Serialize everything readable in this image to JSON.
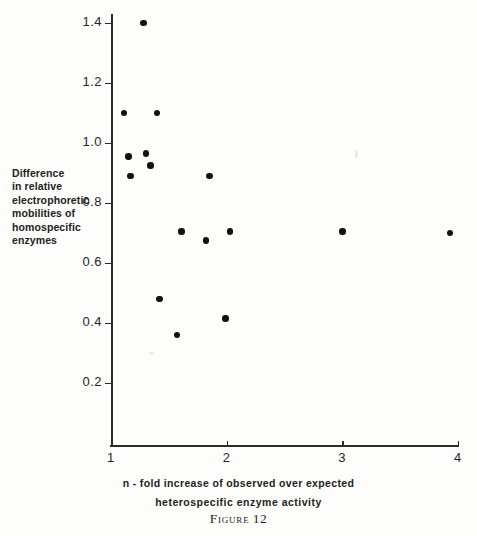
{
  "figure": {
    "caption_label": "Figure",
    "caption_number": "12"
  },
  "axes": {
    "y_title_lines": [
      "Difference",
      "in relative",
      "electrophoretic",
      "mobilities of",
      "homospecific",
      "enzymes"
    ],
    "x_title_line1": "n - fold increase of  observed  over  expected",
    "x_title_line2": "heterospecific   enzyme   activity",
    "x_ticks": [
      "1",
      "2",
      "3",
      "4"
    ],
    "y_ticks": [
      "1.4",
      "1.2",
      "1.0",
      "0.8",
      "0.6",
      "0.4",
      "0.2"
    ]
  },
  "colors": {
    "ink": "#1a1a1a",
    "axis": "#2b2b28",
    "marker": "#111110",
    "paper": "#fdfdfb"
  },
  "chart_data": {
    "type": "scatter",
    "xlabel": "n - fold increase of observed over expected heterospecific enzyme activity",
    "ylabel": "Difference in relative electrophoretic mobilities of homospecific enzymes",
    "xlim": [
      1,
      4
    ],
    "ylim": [
      0.2,
      1.4
    ],
    "xticks": [
      1,
      2,
      3,
      4
    ],
    "yticks": [
      0.2,
      0.4,
      0.6,
      0.8,
      1.0,
      1.2,
      1.4
    ],
    "grid": false,
    "legend": null,
    "marker": "filled-circle",
    "points": [
      {
        "x": 1.28,
        "y": 1.4
      },
      {
        "x": 1.11,
        "y": 1.1
      },
      {
        "x": 1.4,
        "y": 1.1
      },
      {
        "x": 1.15,
        "y": 0.955
      },
      {
        "x": 1.3,
        "y": 0.965
      },
      {
        "x": 1.34,
        "y": 0.925
      },
      {
        "x": 1.17,
        "y": 0.89
      },
      {
        "x": 1.85,
        "y": 0.89
      },
      {
        "x": 1.61,
        "y": 0.705
      },
      {
        "x": 1.82,
        "y": 0.675
      },
      {
        "x": 2.03,
        "y": 0.705
      },
      {
        "x": 3.0,
        "y": 0.705
      },
      {
        "x": 3.93,
        "y": 0.7
      },
      {
        "x": 1.42,
        "y": 0.48
      },
      {
        "x": 1.99,
        "y": 0.415
      },
      {
        "x": 1.57,
        "y": 0.36
      }
    ]
  }
}
